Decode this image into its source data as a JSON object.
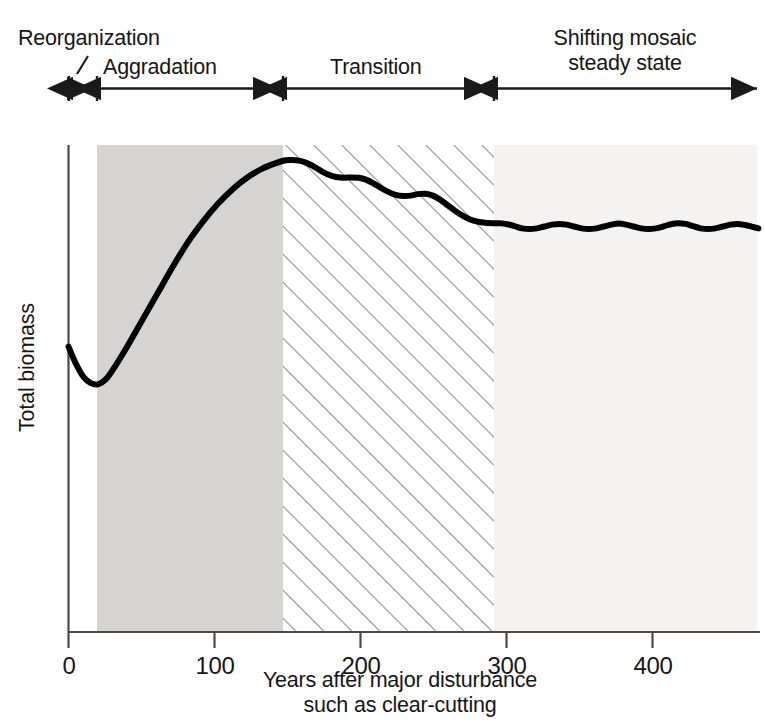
{
  "chart_data": {
    "type": "line",
    "title": "",
    "xlabel": "Years after major disturbance\nsuch as clear-cutting",
    "ylabel": "Total biomass",
    "xlabel_line1": "Years after major disturbance",
    "xlabel_line2": "such as clear-cutting",
    "xlim": [
      0,
      465
    ],
    "ylim": [
      0,
      1
    ],
    "grid": false,
    "legend": "none",
    "xticks": [
      0,
      100,
      200,
      300,
      400
    ],
    "xtick_labels": [
      "0",
      "100",
      "200",
      "300",
      "400"
    ],
    "yticks": [],
    "ytick_labels": [],
    "y_axis_note": "unlabeled qualitative axis (relative total biomass)",
    "series": [
      {
        "name": "Total biomass",
        "color": "#000000",
        "line_width": 6,
        "x": [
          0,
          5,
          10,
          15,
          20,
          25,
          30,
          40,
          50,
          60,
          70,
          80,
          90,
          100,
          110,
          120,
          130,
          140,
          146,
          150,
          155,
          160,
          165,
          170,
          175,
          180,
          185,
          190,
          195,
          200,
          205,
          210,
          215,
          220,
          225,
          230,
          235,
          240,
          245,
          250,
          255,
          260,
          265,
          270,
          275,
          280,
          285,
          290,
          292,
          295,
          300,
          305,
          310,
          315,
          320,
          325,
          330,
          335,
          340,
          345,
          350,
          355,
          360,
          365,
          370,
          375,
          380,
          385,
          390,
          395,
          400,
          405,
          410,
          415,
          420,
          425,
          430,
          435,
          440,
          445,
          450,
          455,
          460,
          464
        ],
        "y": [
          0.466,
          0.42,
          0.385,
          0.368,
          0.365,
          0.378,
          0.405,
          0.47,
          0.54,
          0.61,
          0.68,
          0.745,
          0.8,
          0.848,
          0.888,
          0.92,
          0.944,
          0.96,
          0.967,
          0.968,
          0.966,
          0.96,
          0.95,
          0.938,
          0.928,
          0.922,
          0.92,
          0.921,
          0.92,
          0.915,
          0.905,
          0.893,
          0.882,
          0.874,
          0.871,
          0.872,
          0.876,
          0.877,
          0.872,
          0.861,
          0.846,
          0.831,
          0.818,
          0.808,
          0.802,
          0.799,
          0.798,
          0.798,
          0.797,
          0.795,
          0.79,
          0.784,
          0.782,
          0.784,
          0.789,
          0.794,
          0.796,
          0.794,
          0.789,
          0.784,
          0.782,
          0.784,
          0.789,
          0.794,
          0.797,
          0.794,
          0.789,
          0.784,
          0.782,
          0.784,
          0.789,
          0.795,
          0.798,
          0.796,
          0.79,
          0.784,
          0.782,
          0.784,
          0.789,
          0.794,
          0.796,
          0.793,
          0.788,
          0.784
        ]
      }
    ],
    "phases": [
      {
        "id": "reorganization",
        "label": "Reorganization",
        "x_start": 0,
        "x_end": 19,
        "fill": "#ffffff",
        "pattern": "none",
        "label_lines": [
          "Reorganization"
        ],
        "has_leader_line": true
      },
      {
        "id": "aggradation",
        "label": "Aggradation",
        "x_start": 19,
        "x_end": 146,
        "fill": "#d5d4d2",
        "pattern": "solid",
        "label_lines": [
          "Aggradation"
        ],
        "has_leader_line": false
      },
      {
        "id": "transition",
        "label": "Transition",
        "x_start": 146,
        "x_end": 292,
        "fill": "#ffffff",
        "pattern": "diagonal-hatch",
        "label_lines": [
          "Transition"
        ],
        "has_leader_line": false
      },
      {
        "id": "shifting-mosaic-steady-state",
        "label": "Shifting mosaic steady state",
        "x_start": 292,
        "x_end": 465,
        "fill": "#f4f3f1",
        "pattern": "solid",
        "label_lines": [
          "Shifting mosaic",
          "steady state"
        ],
        "has_leader_line": false
      }
    ],
    "annotations": [
      {
        "name": "phase-bracket-reorganization",
        "type": "double-arrow-bracket",
        "from": 0,
        "to": 19
      },
      {
        "name": "phase-bracket-aggradation",
        "type": "double-arrow-bracket",
        "from": 19,
        "to": 146
      },
      {
        "name": "phase-bracket-transition",
        "type": "double-arrow-bracket",
        "from": 146,
        "to": 292
      },
      {
        "name": "phase-bracket-shifting",
        "type": "double-arrow-bracket",
        "from": 292,
        "to": 465
      }
    ],
    "colors": {
      "curve": "#000000",
      "axis": "#4a4a4a",
      "aggradation_fill": "#d5d4d2",
      "transition_hatch": "#8a8a8a",
      "shifting_fill": "#f4f3f1",
      "text": "#161616"
    }
  },
  "axis": {
    "x_title_line1": "Years after major disturbance",
    "x_title_line2": "such as clear-cutting",
    "y_title": "Total biomass",
    "x_tick_labels": [
      "0",
      "100",
      "200",
      "300",
      "400"
    ]
  },
  "phase_labels": {
    "reorganization": "Reorganization",
    "aggradation": "Aggradation",
    "transition": "Transition",
    "shifting_line1": "Shifting mosaic",
    "shifting_line2": "steady state"
  }
}
